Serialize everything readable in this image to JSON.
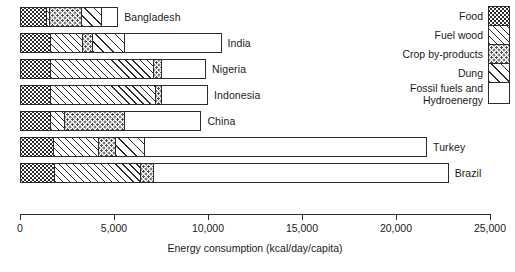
{
  "chart_data": {
    "type": "bar",
    "orientation": "horizontal",
    "stacked": true,
    "title": "",
    "xlabel": "Energy consumption (kcal/day/capita)",
    "ylabel": "",
    "xlim": [
      0,
      25000
    ],
    "xticks": [
      0,
      5000,
      10000,
      15000,
      20000,
      25000
    ],
    "xtick_labels": [
      "0",
      "5,000",
      "10,000",
      "15,000",
      "20,000",
      "25,000"
    ],
    "grid": false,
    "legend_position": "right",
    "categories": [
      "Bangladesh",
      "India",
      "Nigeria",
      "Indonesia",
      "China",
      "Turkey",
      "Brazil"
    ],
    "series": [
      {
        "name": "Food",
        "pattern": "dense-dots",
        "values": [
          1400,
          1600,
          1600,
          1600,
          1600,
          1750,
          1800
        ]
      },
      {
        "name": "Fuel wood",
        "pattern": "diagonal-hatch",
        "values": [
          120,
          1700,
          5500,
          5600,
          750,
          2400,
          4600
        ]
      },
      {
        "name": "Crop by-products",
        "pattern": "sparse-dots",
        "values": [
          1700,
          520,
          400,
          300,
          3200,
          900,
          700
        ]
      },
      {
        "name": "Dung",
        "pattern": "wide-hatch",
        "values": [
          1100,
          1700,
          0,
          0,
          0,
          1550,
          0
        ]
      },
      {
        "name": "Fossil fuels and Hydroenergy",
        "pattern": "plain-white",
        "values": [
          900,
          5200,
          2400,
          2500,
          4100,
          15050,
          15700
        ]
      }
    ],
    "totals": [
      5220,
      10720,
      9900,
      10000,
      9650,
      21650,
      22800
    ]
  },
  "legend": {
    "entries": [
      {
        "label": "Food",
        "pattern": "dense-dots"
      },
      {
        "label": "Fuel wood",
        "pattern": "diagonal-hatch"
      },
      {
        "label": "Crop by-products",
        "pattern": "sparse-dots"
      },
      {
        "label": "Dung",
        "pattern": "wide-hatch"
      },
      {
        "label": "Fossil fuels and\nHydroenergy",
        "pattern": "plain-white"
      }
    ]
  },
  "axis": {
    "title": "Energy consumption (kcal/day/capita)",
    "ticks": [
      "0",
      "5,000",
      "10,000",
      "15,000",
      "20,000",
      "25,000"
    ]
  },
  "colors": {
    "ink": "#2b2b2b",
    "background": "#ffffff",
    "text": "#1a1a1a"
  }
}
